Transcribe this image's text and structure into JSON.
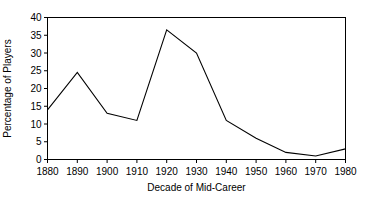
{
  "chart_data": {
    "type": "line",
    "title": "",
    "subtitle": "",
    "xlabel": "Decade of Mid-Career",
    "ylabel": "Percentage of Players",
    "categories": [
      "1880",
      "1890",
      "1900",
      "1910",
      "1920",
      "1930",
      "1940",
      "1950",
      "1960",
      "1970",
      "1980"
    ],
    "x": [
      1880,
      1890,
      1900,
      1910,
      1920,
      1930,
      1940,
      1950,
      1960,
      1970,
      1980
    ],
    "values": [
      14,
      24.5,
      13,
      11,
      36.5,
      30,
      11,
      6,
      2,
      1,
      3
    ],
    "series": [
      {
        "name": "Percentage of Players",
        "values": [
          14,
          24.5,
          13,
          11,
          36.5,
          30,
          11,
          6,
          2,
          1,
          3
        ]
      }
    ],
    "xlim": [
      1880,
      1980
    ],
    "ylim": [
      0,
      40
    ],
    "yticks": [
      0,
      5,
      10,
      15,
      20,
      25,
      30,
      35,
      40
    ],
    "ytick_labels": [
      "0",
      "5",
      "10",
      "15",
      "20",
      "25",
      "30",
      "35",
      "40"
    ],
    "xticks": [
      1880,
      1890,
      1900,
      1910,
      1920,
      1930,
      1940,
      1950,
      1960,
      1970,
      1980
    ],
    "xtick_labels": [
      "1880",
      "1890",
      "1900",
      "1910",
      "1920",
      "1930",
      "1940",
      "1950",
      "1960",
      "1970",
      "1980"
    ],
    "grid": false,
    "legend": false,
    "legend_position": "none",
    "line_color": "#000000",
    "frame_color": "#000000",
    "background_color": "#ffffff",
    "annotations": []
  },
  "axes": {
    "y_title": "Percentage of Players",
    "x_title": "Decade of Mid-Career"
  }
}
